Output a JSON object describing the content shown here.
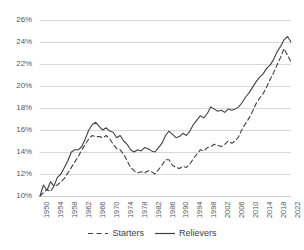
{
  "chart_data": {
    "type": "line",
    "title": "",
    "xlabel": "",
    "ylabel": "",
    "xlim": [
      1950,
      2022
    ],
    "ylim": [
      0.1,
      0.26
    ],
    "grid": true,
    "grid_axis": "y",
    "legend_position": "bottom",
    "y_tick_labels": [
      "26%",
      "24%",
      "22%",
      "20%",
      "18%",
      "16%",
      "14%",
      "12%",
      "10%"
    ],
    "y_tick_values": [
      0.26,
      0.24,
      0.22,
      0.2,
      0.18,
      0.16,
      0.14,
      0.12,
      0.1
    ],
    "x_tick_labels": [
      "1950",
      "1954",
      "1958",
      "1962",
      "1966",
      "1970",
      "1974",
      "1978",
      "1982",
      "1986",
      "1990",
      "1994",
      "1998",
      "2002",
      "2006",
      "2010",
      "2014",
      "2018",
      "2022"
    ],
    "x_tick_values": [
      1950,
      1954,
      1958,
      1962,
      1966,
      1970,
      1974,
      1978,
      1982,
      1986,
      1990,
      1994,
      1998,
      2002,
      2006,
      2010,
      2014,
      2018,
      2022
    ],
    "x": [
      1950,
      1951,
      1952,
      1953,
      1954,
      1955,
      1956,
      1957,
      1958,
      1959,
      1960,
      1961,
      1962,
      1963,
      1964,
      1965,
      1966,
      1967,
      1968,
      1969,
      1970,
      1971,
      1972,
      1973,
      1974,
      1975,
      1976,
      1977,
      1978,
      1979,
      1980,
      1981,
      1982,
      1983,
      1984,
      1985,
      1986,
      1987,
      1988,
      1989,
      1990,
      1991,
      1992,
      1993,
      1994,
      1995,
      1996,
      1997,
      1998,
      1999,
      2000,
      2001,
      2002,
      2003,
      2004,
      2005,
      2006,
      2007,
      2008,
      2009,
      2010,
      2011,
      2012,
      2013,
      2014,
      2015,
      2016,
      2017,
      2018,
      2019,
      2020,
      2021,
      2022
    ],
    "series": [
      {
        "name": "Starters",
        "style": "dashed",
        "color": "#404040",
        "values": [
          0.1,
          0.103,
          0.106,
          0.104,
          0.109,
          0.11,
          0.113,
          0.116,
          0.121,
          0.126,
          0.131,
          0.136,
          0.142,
          0.147,
          0.152,
          0.155,
          0.154,
          0.154,
          0.153,
          0.155,
          0.152,
          0.147,
          0.143,
          0.142,
          0.138,
          0.132,
          0.126,
          0.123,
          0.121,
          0.122,
          0.121,
          0.123,
          0.122,
          0.12,
          0.124,
          0.128,
          0.133,
          0.133,
          0.128,
          0.126,
          0.125,
          0.127,
          0.126,
          0.129,
          0.134,
          0.138,
          0.142,
          0.141,
          0.144,
          0.145,
          0.147,
          0.146,
          0.145,
          0.147,
          0.15,
          0.148,
          0.15,
          0.154,
          0.161,
          0.166,
          0.171,
          0.177,
          0.184,
          0.189,
          0.193,
          0.199,
          0.206,
          0.212,
          0.219,
          0.226,
          0.234,
          0.228,
          0.222
        ]
      },
      {
        "name": "Relievers",
        "style": "solid",
        "color": "#404040",
        "values": [
          0.1,
          0.11,
          0.105,
          0.113,
          0.109,
          0.117,
          0.12,
          0.126,
          0.132,
          0.14,
          0.142,
          0.142,
          0.145,
          0.152,
          0.16,
          0.165,
          0.167,
          0.163,
          0.16,
          0.162,
          0.159,
          0.158,
          0.153,
          0.155,
          0.15,
          0.147,
          0.142,
          0.14,
          0.142,
          0.141,
          0.144,
          0.143,
          0.141,
          0.14,
          0.144,
          0.148,
          0.155,
          0.159,
          0.156,
          0.153,
          0.154,
          0.157,
          0.155,
          0.159,
          0.165,
          0.169,
          0.173,
          0.171,
          0.175,
          0.181,
          0.179,
          0.177,
          0.178,
          0.176,
          0.179,
          0.178,
          0.179,
          0.181,
          0.185,
          0.19,
          0.194,
          0.199,
          0.204,
          0.208,
          0.211,
          0.216,
          0.219,
          0.224,
          0.231,
          0.236,
          0.242,
          0.245,
          0.24
        ]
      }
    ]
  },
  "legend": {
    "items": [
      {
        "label": "Starters",
        "style": "dashed"
      },
      {
        "label": "Relievers",
        "style": "solid"
      }
    ]
  },
  "colors": {
    "line": "#404040",
    "grid": "#c8c8c8",
    "axis_text": "#595959",
    "background": "#ffffff"
  }
}
